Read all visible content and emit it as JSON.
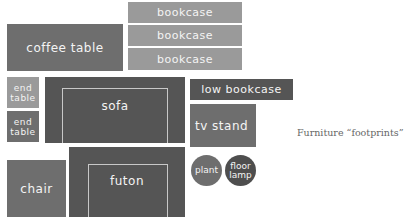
{
  "diagram": {
    "caption": "Furniture “footprints”",
    "pieces": {
      "coffee_table": {
        "label": "coffee table",
        "color": "#6e6e6e"
      },
      "bookcase_1": {
        "label": "bookcase",
        "color": "#9a9a9a"
      },
      "bookcase_2": {
        "label": "bookcase",
        "color": "#9a9a9a"
      },
      "bookcase_3": {
        "label": "bookcase",
        "color": "#9a9a9a"
      },
      "end_table_1": {
        "label_line1": "end",
        "label_line2": "table",
        "color": "#9a9a9a"
      },
      "end_table_2": {
        "label_line1": "end",
        "label_line2": "table",
        "color": "#6e6e6e"
      },
      "sofa": {
        "label": "sofa",
        "color": "#555555"
      },
      "low_bookcase": {
        "label": "low bookcase",
        "color": "#555555"
      },
      "tv_stand": {
        "label": "tv stand",
        "color": "#6e6e6e"
      },
      "chair": {
        "label": "chair",
        "color": "#6e6e6e"
      },
      "futon": {
        "label": "futon",
        "color": "#555555"
      },
      "plant": {
        "label": "plant",
        "color": "#6e6e6e"
      },
      "floor_lamp": {
        "label_line1": "floor",
        "label_line2": "lamp",
        "color": "#4e4e4e"
      }
    }
  }
}
